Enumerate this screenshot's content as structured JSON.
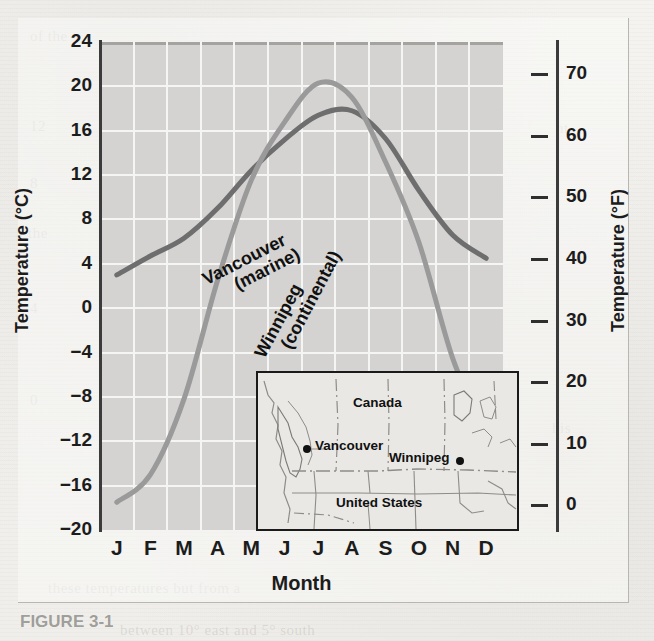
{
  "figure": {
    "caption_partial": "FIGURE 3-1"
  },
  "background_text": [
    "of the",
    "12",
    "8",
    "the",
    "4",
    "0",
    "between 10° east and 5° south",
    "these temperatures but from a",
    "in the"
  ],
  "chart_data": {
    "type": "line",
    "title": "",
    "xlabel": "Month",
    "ylabel": "Temperature (°C)",
    "ylabel_secondary": "Temperature (°F)",
    "categories": [
      "J",
      "F",
      "M",
      "A",
      "M",
      "J",
      "J",
      "A",
      "S",
      "O",
      "N",
      "D"
    ],
    "ylim": [
      -20,
      24
    ],
    "yticks": [
      24,
      20,
      16,
      12,
      8,
      4,
      0,
      -4,
      -8,
      -12,
      -16,
      -20
    ],
    "ylim_secondary": [
      -4,
      75.2
    ],
    "yticks_secondary": [
      70,
      60,
      50,
      40,
      30,
      20,
      10,
      0
    ],
    "grid": true,
    "legend": "inline-labels",
    "series": [
      {
        "name": "Vancouver (marine)",
        "label_line1": "Vancouver",
        "label_line2": "(marine)",
        "color": "#6e6e6e",
        "values": [
          3.0,
          4.7,
          6.3,
          9.0,
          12.4,
          15.2,
          17.4,
          17.8,
          15.3,
          10.6,
          6.6,
          4.5
        ]
      },
      {
        "name": "Winnipeg (continental)",
        "label_line1": "Winnipeg",
        "label_line2": "(continental)",
        "color": "#9a9a9a",
        "values": [
          -17.5,
          -15.0,
          -8.2,
          2.5,
          11.5,
          16.8,
          20.3,
          19.0,
          13.2,
          5.9,
          -4.5,
          -11.5
        ]
      }
    ]
  },
  "inset_map": {
    "country_north": "Canada",
    "country_south": "United States",
    "cities": [
      {
        "name": "Vancouver",
        "label_side": "right"
      },
      {
        "name": "Winnipeg",
        "label_side": "left"
      }
    ]
  }
}
